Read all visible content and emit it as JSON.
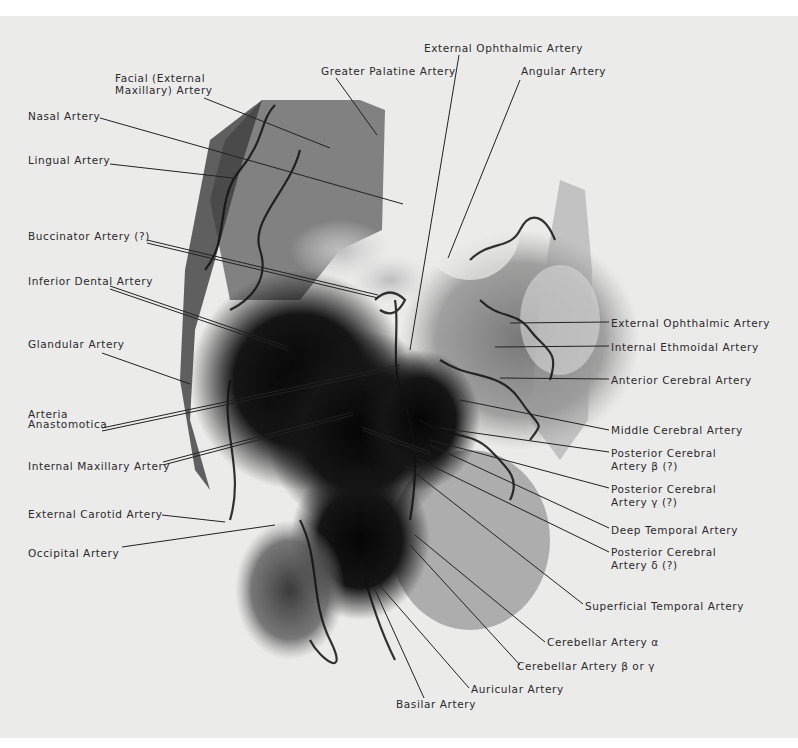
{
  "figure": {
    "type": "angiogram radiograph",
    "colors": {
      "page": "#ebebea",
      "surround": "#ffffff",
      "ink": "#2a2a2a",
      "vessel": "#0d0d0d"
    }
  },
  "labels": {
    "left": [
      {
        "id": "facial",
        "text": "Facial (External\nMaxillary) Artery",
        "x": 115,
        "y": 72
      },
      {
        "id": "nasal",
        "text": "Nasal Artery",
        "x": 28,
        "y": 110
      },
      {
        "id": "lingual",
        "text": "Lingual Artery",
        "x": 28,
        "y": 154
      },
      {
        "id": "buccinator",
        "text": "Buccinator Artery (?)",
        "x": 28,
        "y": 230
      },
      {
        "id": "inferior-dental",
        "text": "Inferior Dental Artery",
        "x": 28,
        "y": 275
      },
      {
        "id": "glandular",
        "text": "Glandular Artery",
        "x": 28,
        "y": 338
      },
      {
        "id": "arteria-anastomotica",
        "text": "Arteria\nAnastomotica",
        "x": 28,
        "y": 409
      },
      {
        "id": "internal-maxillary",
        "text": "Internal Maxillary Artery",
        "x": 28,
        "y": 460
      },
      {
        "id": "external-carotid",
        "text": "External Carotid Artery",
        "x": 28,
        "y": 508
      },
      {
        "id": "occipital",
        "text": "Occipital Artery",
        "x": 28,
        "y": 547
      }
    ],
    "top": [
      {
        "id": "external-ophthalmic-top",
        "text": "External Ophthalmic Artery",
        "x": 424,
        "y": 42
      },
      {
        "id": "greater-palatine",
        "text": "Greater Palatine Artery",
        "x": 321,
        "y": 65
      },
      {
        "id": "angular",
        "text": "Angular Artery",
        "x": 521,
        "y": 65
      }
    ],
    "right": [
      {
        "id": "external-ophthalmic-right",
        "text": "External Ophthalmic Artery",
        "x": 611,
        "y": 317
      },
      {
        "id": "internal-ethmoidal",
        "text": "Internal Ethmoidal Artery",
        "x": 611,
        "y": 341
      },
      {
        "id": "anterior-cerebral",
        "text": "Anterior Cerebral Artery",
        "x": 611,
        "y": 374
      },
      {
        "id": "middle-cerebral",
        "text": "Middle Cerebral Artery",
        "x": 611,
        "y": 424
      },
      {
        "id": "posterior-cerebral-beta",
        "text": "Posterior Cerebral\nArtery β (?)",
        "x": 611,
        "y": 447
      },
      {
        "id": "posterior-cerebral-gamma",
        "text": "Posterior Cerebral\nArtery γ (?)",
        "x": 611,
        "y": 483
      },
      {
        "id": "deep-temporal",
        "text": "Deep Temporal Artery",
        "x": 611,
        "y": 524
      },
      {
        "id": "posterior-cerebral-delta",
        "text": "Posterior Cerebral\nArtery δ (?)",
        "x": 611,
        "y": 546
      },
      {
        "id": "superficial-temporal",
        "text": "Superficial Temporal Artery",
        "x": 585,
        "y": 600
      }
    ],
    "bottom": [
      {
        "id": "cerebellar-alpha",
        "text": "Cerebellar Artery α",
        "x": 547,
        "y": 636
      },
      {
        "id": "cerebellar-beta-gamma",
        "text": "Cerebellar Artery β or γ",
        "x": 517,
        "y": 660
      },
      {
        "id": "auricular",
        "text": "Auricular Artery",
        "x": 471,
        "y": 683
      },
      {
        "id": "basilar",
        "text": "Basilar Artery",
        "x": 396,
        "y": 698
      }
    ]
  }
}
